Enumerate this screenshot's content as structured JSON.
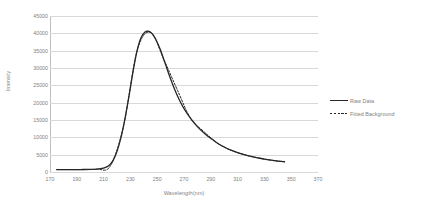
{
  "chart_data": {
    "type": "line",
    "title": "",
    "xlabel": "Wavelength(nm)",
    "ylabel": "Intensity",
    "xlim": [
      170,
      370
    ],
    "ylim": [
      0,
      45000
    ],
    "grid": true,
    "legend_position": "right",
    "x_ticks": [
      170,
      190,
      210,
      230,
      250,
      270,
      290,
      310,
      330,
      350,
      370
    ],
    "y_ticks": [
      0,
      5000,
      10000,
      15000,
      20000,
      25000,
      30000,
      35000,
      40000,
      45000
    ],
    "series": [
      {
        "name": "Raw Data",
        "style": "solid",
        "color": "#262626",
        "x": [
          175,
          180,
          185,
          190,
          195,
          200,
          205,
          208,
          211,
          214,
          217,
          220,
          223,
          226,
          229,
          232,
          235,
          238,
          241,
          243,
          245,
          247,
          249,
          252,
          255,
          258,
          261,
          264,
          267,
          270,
          274,
          278,
          282,
          286,
          290,
          295,
          300,
          305,
          310,
          315,
          320,
          325,
          330,
          335,
          340,
          345
        ],
        "y": [
          700,
          700,
          700,
          700,
          720,
          760,
          850,
          980,
          1250,
          1900,
          3300,
          6000,
          10000,
          15500,
          22000,
          29000,
          35000,
          38800,
          40400,
          40600,
          40300,
          39500,
          38200,
          35600,
          32400,
          29000,
          25800,
          22900,
          20400,
          18300,
          16000,
          14000,
          12300,
          10900,
          9700,
          8300,
          7200,
          6300,
          5600,
          5000,
          4500,
          4100,
          3700,
          3400,
          3150,
          2950
        ]
      },
      {
        "name": "Fitted Background",
        "style": "dashed",
        "color": "#262626",
        "x": [
          175,
          185,
          195,
          205,
          215,
          225,
          235,
          245,
          255,
          265,
          275,
          285,
          295,
          305,
          315,
          325,
          335,
          345
        ],
        "y": [
          700,
          700,
          700,
          830,
          1700,
          13500,
          35000,
          40300,
          32400,
          23700,
          15400,
          11600,
          8300,
          6300,
          5000,
          4100,
          3400,
          2950
        ]
      }
    ]
  },
  "legend": {
    "items": [
      {
        "label": "Raw Data",
        "style": "solid"
      },
      {
        "label": "Fitted Background",
        "style": "dashed"
      }
    ]
  }
}
